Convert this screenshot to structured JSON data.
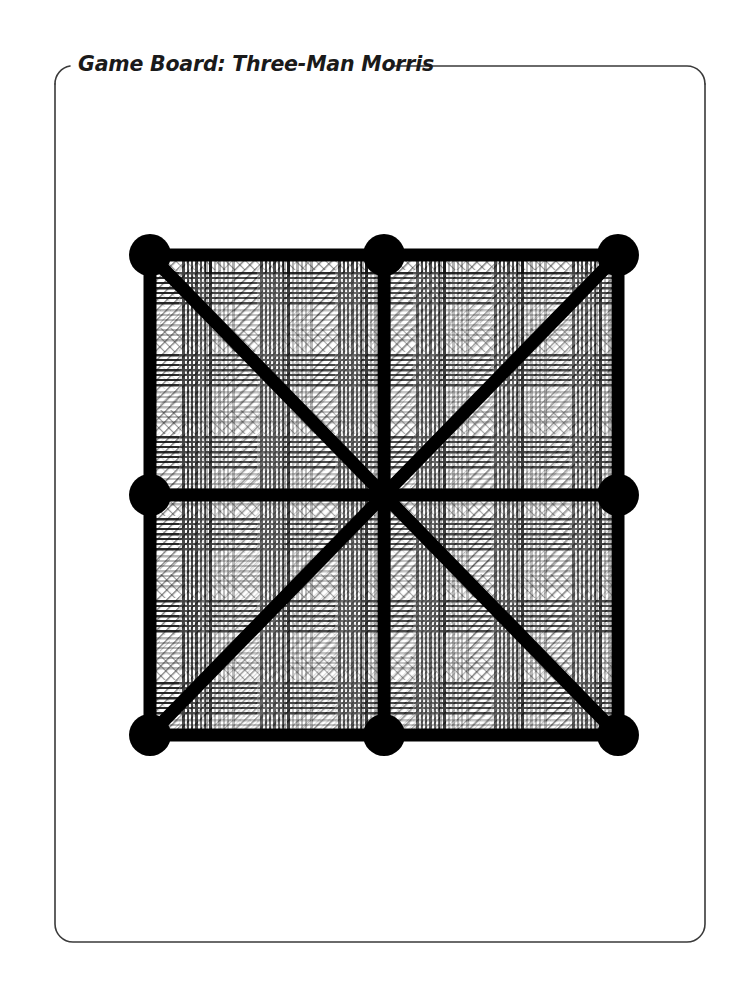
{
  "page": {
    "background_color": "#ffffff",
    "width": 743,
    "height": 1004
  },
  "frame": {
    "name": "rounded-panel-frame",
    "stroke_color": "#3a3a3a",
    "stroke_width": 1.6,
    "corner_radius": 18,
    "bounds": {
      "x": 55,
      "y": 66,
      "width": 650,
      "height": 876
    },
    "title_gap": {
      "start_x": 70,
      "end_x": 392
    }
  },
  "title": {
    "text": "Game Board: Three-Man Morris",
    "color": "#1a1a1a"
  },
  "board": {
    "name": "three-man-morris-board",
    "description": "Three-Man Morris grid: square outline with midpoint lines and both diagonals",
    "line_color": "#000000",
    "node_color": "#000000",
    "line_width": 13,
    "node_radius": 21,
    "fill_texture": "tartan-plaid-hatch",
    "bounds": {
      "x": 150,
      "y": 255,
      "width": 468,
      "height": 480
    },
    "points": [
      {
        "id": "top-left",
        "label": "Top Left",
        "x": 150,
        "y": 255,
        "has_node": true
      },
      {
        "id": "top-center",
        "label": "Top Center",
        "x": 384,
        "y": 255,
        "has_node": true
      },
      {
        "id": "top-right",
        "label": "Top Right",
        "x": 618,
        "y": 255,
        "has_node": true
      },
      {
        "id": "middle-left",
        "label": "Middle Left",
        "x": 150,
        "y": 495,
        "has_node": true
      },
      {
        "id": "center",
        "label": "Center",
        "x": 384,
        "y": 495,
        "has_node": false
      },
      {
        "id": "middle-right",
        "label": "Middle Right",
        "x": 618,
        "y": 495,
        "has_node": true
      },
      {
        "id": "bottom-left",
        "label": "Bottom Left",
        "x": 150,
        "y": 735,
        "has_node": true
      },
      {
        "id": "bottom-center",
        "label": "Bottom Center",
        "x": 384,
        "y": 735,
        "has_node": true
      },
      {
        "id": "bottom-right",
        "label": "Bottom Right",
        "x": 618,
        "y": 735,
        "has_node": true
      }
    ],
    "lines": [
      {
        "id": "top-edge",
        "from": "top-left",
        "to": "top-right"
      },
      {
        "id": "bottom-edge",
        "from": "bottom-left",
        "to": "bottom-right"
      },
      {
        "id": "left-edge",
        "from": "top-left",
        "to": "bottom-left"
      },
      {
        "id": "right-edge",
        "from": "top-right",
        "to": "bottom-right"
      },
      {
        "id": "horizontal-median",
        "from": "middle-left",
        "to": "middle-right"
      },
      {
        "id": "vertical-median",
        "from": "top-center",
        "to": "bottom-center"
      },
      {
        "id": "diagonal-nw-se",
        "from": "top-left",
        "to": "bottom-right"
      },
      {
        "id": "diagonal-ne-sw",
        "from": "top-right",
        "to": "bottom-left"
      }
    ]
  }
}
